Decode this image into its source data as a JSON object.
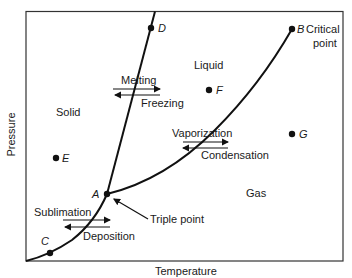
{
  "diagram": {
    "type": "phase-diagram",
    "axes": {
      "x_label": "Temperature",
      "y_label": "Pressure"
    },
    "regions": {
      "solid": "Solid",
      "liquid": "Liquid",
      "gas": "Gas"
    },
    "points": {
      "A": "A",
      "B": "B",
      "C": "C",
      "D": "D",
      "E": "E",
      "F": "F",
      "G": "G"
    },
    "annotations": {
      "critical_1": "Critical",
      "critical_2": "point",
      "triple": "Triple point"
    },
    "transitions": {
      "melting": "Melting",
      "freezing": "Freezing",
      "vaporization": "Vaporization",
      "condensation": "Condensation",
      "sublimation": "Sublimation",
      "deposition": "Deposition"
    },
    "colors": {
      "line": "#111111",
      "frame": "#333333",
      "text": "#1a1a1a"
    }
  }
}
